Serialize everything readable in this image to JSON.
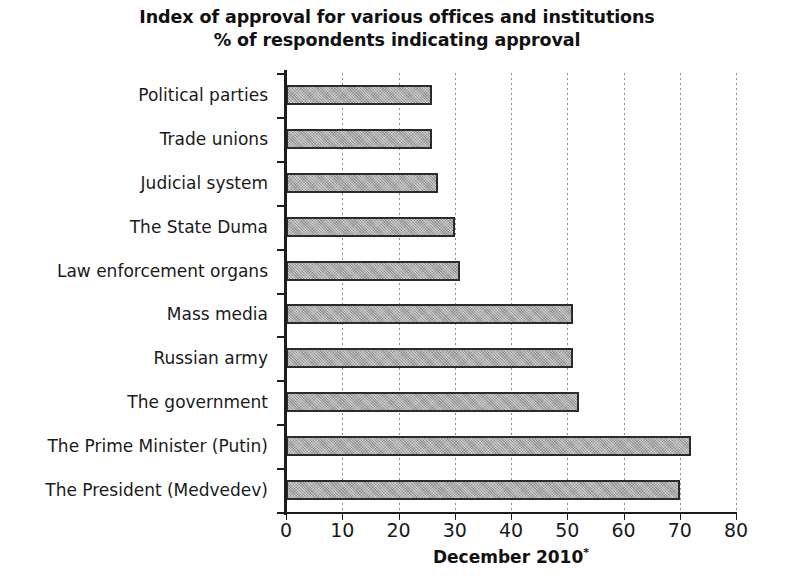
{
  "chart_data": {
    "type": "bar",
    "orientation": "horizontal",
    "title": "Index of approval for various offices and institutions",
    "subtitle": "% of respondents indicating approval",
    "xlabel": "December 2010",
    "xlabel_footnote_marker": "*",
    "ylabel": "",
    "xlim": [
      0,
      80
    ],
    "xticks": [
      0,
      10,
      20,
      30,
      40,
      50,
      60,
      70,
      80
    ],
    "xtick_labels": [
      "0",
      "10",
      "20",
      "30",
      "40",
      "50",
      "60",
      "70",
      "80"
    ],
    "grid": "vertical-dotted",
    "legend": "none",
    "bar_fill_color": "#a5a5a5",
    "bar_border_color": "#2b2b2b",
    "categories": [
      "Political parties",
      "Trade unions",
      "Judicial system",
      "The State Duma",
      "Law enforcement organs",
      "Mass media",
      "Russian army",
      "The government",
      "The Prime Minister (Putin)",
      "The President (Medvedev)"
    ],
    "values": [
      26,
      26,
      27,
      30,
      31,
      51,
      51,
      52,
      72,
      70
    ],
    "series": [
      {
        "name": "December 2010",
        "values": [
          26,
          26,
          27,
          30,
          31,
          51,
          51,
          52,
          72,
          70
        ]
      }
    ]
  }
}
